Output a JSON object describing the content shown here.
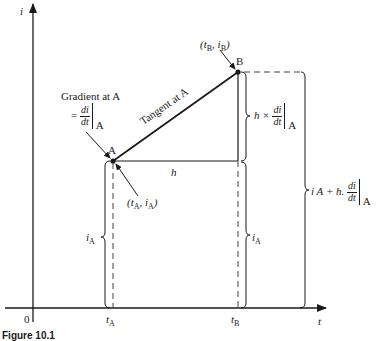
{
  "axes": {
    "y_label": "i",
    "x_label": "t",
    "origin_label": "0"
  },
  "points": {
    "a": {
      "label": "A",
      "coord_label_t": "t",
      "coord_label_i": "i",
      "coord_sub": "A"
    },
    "b": {
      "label": "B",
      "coord_label_t": "t",
      "coord_label_i": "i",
      "coord_sub": "B"
    }
  },
  "annotations": {
    "gradient_title": "Gradient at A",
    "gradient_eq": "=",
    "di": "di",
    "dt": "dt",
    "at_a": "A",
    "tangent": "Tangent at A",
    "h": "h",
    "h_times": "h ×",
    "ia_left": "i",
    "ia_left_sub": "A",
    "ia_right": "i",
    "ia_right_sub": "A",
    "total_prefix": "i A + h.",
    "ta_tick": "t",
    "ta_sub": "A",
    "tb_tick": "t",
    "tb_sub": "B"
  },
  "caption": "Figure 10.1",
  "colors": {
    "ink": "#1a1a1a",
    "background": "#ffffff"
  }
}
